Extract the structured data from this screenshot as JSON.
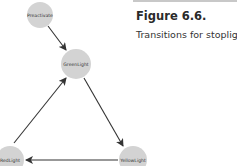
{
  "figure": {
    "title": "Figure 6.6.",
    "caption": "Transitions for stoplight."
  },
  "diagram": {
    "node_color": "#d3d3d3",
    "edge_color": "#333333",
    "nodes": [
      {
        "id": "preactivate",
        "label": "Preactivate",
        "cx": 40,
        "cy": 15,
        "r": 13
      },
      {
        "id": "greenlight",
        "label": "GreenLight",
        "cx": 76,
        "cy": 64,
        "r": 15
      },
      {
        "id": "yellowlight",
        "label": "YellowLight",
        "cx": 133,
        "cy": 160,
        "r": 14
      },
      {
        "id": "redlight",
        "label": "RedLight",
        "cx": 10,
        "cy": 160,
        "r": 14
      }
    ],
    "edges": [
      {
        "from": "Preactivate",
        "to": "GreenLight"
      },
      {
        "from": "GreenLight",
        "to": "YellowLight"
      },
      {
        "from": "YellowLight",
        "to": "RedLight"
      },
      {
        "from": "RedLight",
        "to": "GreenLight"
      }
    ]
  }
}
